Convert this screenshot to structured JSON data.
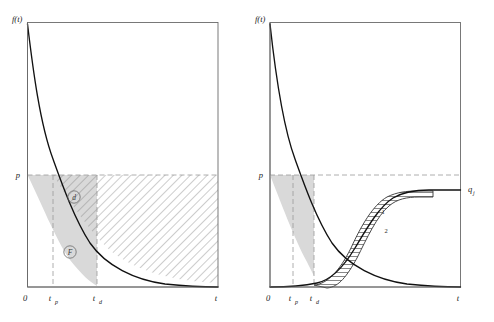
{
  "figure": {
    "background": "#ffffff",
    "ink": "#1a1a1a",
    "curve_color": "#111111",
    "dashed_color": "#9a9a9a",
    "frame_color": "#6a6a6a",
    "shade_color": "#d9d9d9",
    "hatch_color": "#6e6e6e"
  },
  "panels": [
    {
      "id": "left",
      "name": "decay-with-hatched-area-panel",
      "y_axis_label": "f(t)",
      "x_axis_label": "t",
      "origin_label": "0",
      "y_threshold_label": "p",
      "ticks": [
        {
          "label": "t",
          "sub": "p"
        },
        {
          "label": "t",
          "sub": "d"
        }
      ],
      "region_labels": [
        {
          "text": "d",
          "circled": true,
          "name": "region-d"
        },
        {
          "text": "F",
          "circled": true,
          "name": "region-f"
        }
      ],
      "curve": {
        "type": "exponential-decay",
        "description": "f(t) decays from near top of frame toward a low asymptote",
        "start_value": 1.0,
        "asymptote": 0.06,
        "decay_rate": 4.2
      },
      "shaded_area": {
        "name": "gray-area-between-tp-and-td",
        "fill": "#d9d9d9",
        "x_from_tick": "t_p",
        "x_to_tick": "t_d",
        "bounded_above_by": "p",
        "bounded_below_by": "curve"
      },
      "hatched_area": {
        "name": "diagonal-hatched-area",
        "direction": "down-right",
        "spacing_px": 6,
        "x_from_tick": "t_p",
        "x_to_axis_end": "t",
        "bounded_above_by": "p",
        "bounded_below_by": "curve"
      }
    },
    {
      "id": "right",
      "name": "decay-and-growth-crossing-panel",
      "y_axis_label": "f(t)",
      "x_axis_label": "t",
      "origin_label": "0",
      "y_threshold_label": "p",
      "right_label": "q",
      "right_label_sub": "j",
      "ticks": [
        {
          "label": "t",
          "sub": "p"
        },
        {
          "label": "t",
          "sub": "d"
        }
      ],
      "band_labels": [
        "1",
        "2"
      ],
      "decay_curve": {
        "type": "exponential-decay",
        "start_value": 1.0,
        "asymptote": 0.08,
        "decay_rate": 4.2
      },
      "growth_curves": [
        {
          "name": "curve-1-upper",
          "type": "logistic",
          "plateau": 0.66,
          "midpoint_frac": 0.62,
          "steepness": 11
        },
        {
          "name": "curve-2-lower",
          "type": "logistic",
          "plateau": 0.66,
          "midpoint_frac": 0.7,
          "steepness": 11
        }
      ],
      "shaded_area": {
        "name": "gray-area-between-tp-and-td",
        "fill": "#d9d9d9",
        "x_from_tick": "t_p",
        "x_to_tick": "t_d",
        "bounded_above_by": "p",
        "bounded_below_by": "decay-curve"
      },
      "hatched_band": {
        "name": "horizontal-hatched-band",
        "direction": "horizontal",
        "spacing_px": 4,
        "between": [
          "curve-1-upper",
          "curve-2-lower"
        ]
      }
    }
  ]
}
